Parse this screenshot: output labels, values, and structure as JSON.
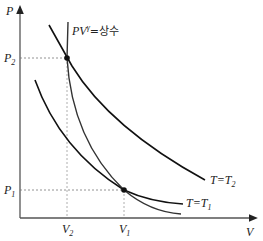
{
  "diagram": {
    "title": "",
    "axes": {
      "y_label": "P",
      "x_label": "V"
    },
    "tick_labels": {
      "p2": {
        "base": "P",
        "sub": "2"
      },
      "p1": {
        "base": "P",
        "sub": "1"
      },
      "v2": {
        "base": "V",
        "sub": "2"
      },
      "v1": {
        "base": "V",
        "sub": "1"
      }
    },
    "curves": [
      {
        "id": "isotherm-t2",
        "label_base": "T",
        "label_eq": "=",
        "label_var": "T",
        "label_sub": "2"
      },
      {
        "id": "isotherm-t1",
        "label_base": "T",
        "label_eq": "=",
        "label_var": "T",
        "label_sub": "1"
      },
      {
        "id": "adiabat",
        "label_pv": "PV",
        "label_exp": "γ",
        "label_rest": "=상수"
      }
    ],
    "points": [
      {
        "name": "state-2",
        "coords": "(V2, P2)"
      },
      {
        "name": "state-1",
        "coords": "(V1, P1)"
      }
    ],
    "colors": {
      "axis": "#555555",
      "isotherm": "#111111",
      "adiabat": "#333333",
      "guide": "#777777"
    }
  }
}
